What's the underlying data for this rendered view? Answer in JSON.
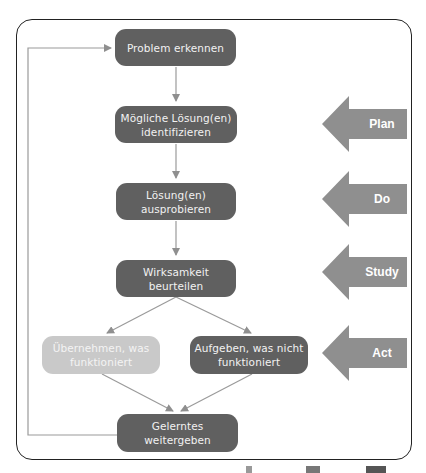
{
  "diagram": {
    "steps": [
      {
        "id": "problem",
        "label": "Problem erkennen"
      },
      {
        "id": "identify",
        "label": "Mögliche Lösung(en) identifizieren"
      },
      {
        "id": "try",
        "label": "Lösung(en) ausprobieren"
      },
      {
        "id": "evaluate",
        "label": "Wirksamkeit beurteilen"
      },
      {
        "id": "adopt",
        "label": "Übernehmen, was funktioniert"
      },
      {
        "id": "abandon",
        "label": "Aufgeben, was nicht funktioniert"
      },
      {
        "id": "share",
        "label": "Gelerntes weitergeben"
      }
    ],
    "phases": [
      {
        "label": "Plan"
      },
      {
        "label": "Do"
      },
      {
        "label": "Study"
      },
      {
        "label": "Act"
      }
    ],
    "colors": {
      "dark_box": "#606060",
      "light_box": "#c9c9c9",
      "arrow": "#8f8f8f",
      "phase_arrow": "#8f8f8f",
      "frame": "#222222"
    }
  }
}
